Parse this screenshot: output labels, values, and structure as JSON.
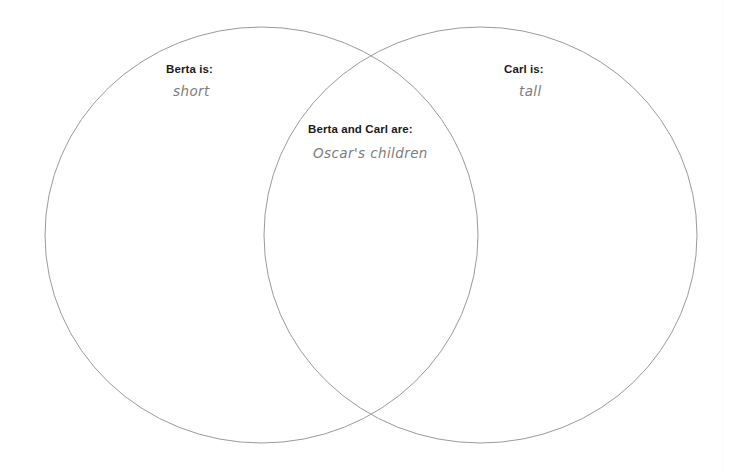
{
  "diagram": {
    "type": "venn",
    "background_color": "#ffffff",
    "stroke_color": "#9a9a9a",
    "heading_color": "#1b1b1b",
    "value_color": "#7d7d7d",
    "sets": [
      {
        "id": "left",
        "name": "Berta",
        "heading": "Berta is:",
        "value": "short"
      },
      {
        "id": "right",
        "name": "Carl",
        "heading": "Carl is:",
        "value": "tall"
      }
    ],
    "intersection": {
      "id": "center",
      "heading": "Berta and Carl are:",
      "value": "Oscar's children"
    }
  }
}
